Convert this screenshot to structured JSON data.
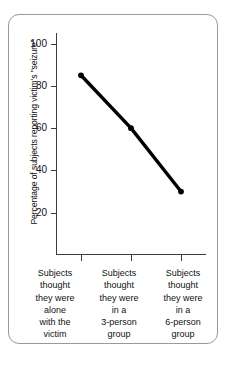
{
  "chart_data": {
    "type": "line",
    "title": "",
    "xlabel": "",
    "ylabel": "Percentage of subjects reporting victim's \"seizure\"",
    "categories": [
      "Subjects thought they were alone with the victim",
      "Subjects thought they were in a 3-person group",
      "Subjects thought they were in a 6-person group"
    ],
    "values": [
      85,
      60,
      30
    ],
    "ylim": [
      0,
      100
    ],
    "ytick_labels": [
      "100",
      "80",
      "60",
      "40",
      "20"
    ],
    "ytick_values": [
      100,
      80,
      60,
      40,
      20
    ],
    "grid": false,
    "legend": null,
    "marker": "circle",
    "line_color": "#000000",
    "marker_color": "#000000"
  },
  "axis": {
    "y_title": "Percentage of subjects reporting victim's \"seizure\"",
    "ticks": [
      {
        "label": "100",
        "value": 100
      },
      {
        "label": "80",
        "value": 80
      },
      {
        "label": "60",
        "value": 60
      },
      {
        "label": "40",
        "value": 40
      },
      {
        "label": "20",
        "value": 20
      }
    ]
  },
  "categories": [
    {
      "lines": [
        "Subjects",
        "thought",
        "they were",
        "alone",
        "with the",
        "victim"
      ]
    },
    {
      "lines": [
        "Subjects",
        "thought",
        "they were",
        "in a",
        "3-person",
        "group"
      ]
    },
    {
      "lines": [
        "Subjects",
        "thought",
        "they were",
        "in a",
        "6-person",
        "group"
      ]
    }
  ],
  "colors": {
    "line": "#000000",
    "axis": "#3c3c3c",
    "frame": "#9a9a9a",
    "text": "#111111",
    "background": "#ffffff"
  }
}
